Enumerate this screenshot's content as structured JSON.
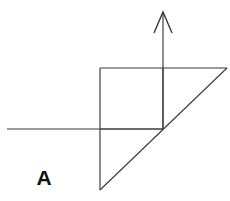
{
  "figure": {
    "label": "A",
    "background_color": "#ffffff",
    "stroke_color": "#3a3a3a",
    "label_color": "#111111",
    "canvas": {
      "width": 230,
      "height": 201
    },
    "elements": {
      "horizontal_axis": {
        "name": "horizontal-axis-line",
        "x1": 7,
        "y1": 129,
        "x2": 163,
        "y2": 129
      },
      "vertical_arrow_shaft": {
        "name": "vertical-arrow-shaft",
        "x1": 163,
        "y1": 13,
        "x2": 163,
        "y2": 129
      },
      "arrow_head": {
        "name": "arrow-head",
        "apex_x": 163,
        "apex_y": 12,
        "left_x": 154,
        "left_y": 33,
        "right_x": 172,
        "right_y": 33
      },
      "square_top_edge": {
        "name": "square-top-edge",
        "x1": 100,
        "y1": 68,
        "x2": 163,
        "y2": 68
      },
      "square_left_edge": {
        "name": "square-left-edge",
        "x1": 100,
        "y1": 68,
        "x2": 100,
        "y2": 129
      },
      "square_bottom_edge": {
        "name": "square-bottom-edge",
        "x1": 100,
        "y1": 129,
        "x2": 163,
        "y2": 129
      },
      "square_right_edge": {
        "name": "square-right-edge",
        "x1": 163,
        "y1": 68,
        "x2": 163,
        "y2": 129
      },
      "upper_horizontal_extension": {
        "name": "upper-horizontal-extension",
        "x1": 163,
        "y1": 68,
        "x2": 227,
        "y2": 68
      },
      "triangle_vertical_leg": {
        "name": "triangle-vertical-leg",
        "x1": 100,
        "y1": 129,
        "x2": 100,
        "y2": 190
      },
      "triangle_hypotenuse": {
        "name": "triangle-hypotenuse",
        "x1": 100,
        "y1": 190,
        "x2": 227,
        "y2": 68
      }
    }
  }
}
